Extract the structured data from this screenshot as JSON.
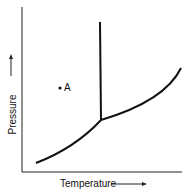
{
  "diagram": {
    "type": "phase-diagram",
    "x_axis_label": "Temperature",
    "y_axis_label": "Pressure",
    "point_label": "A",
    "colors": {
      "line": "#111111",
      "background": "#ffffff"
    }
  }
}
